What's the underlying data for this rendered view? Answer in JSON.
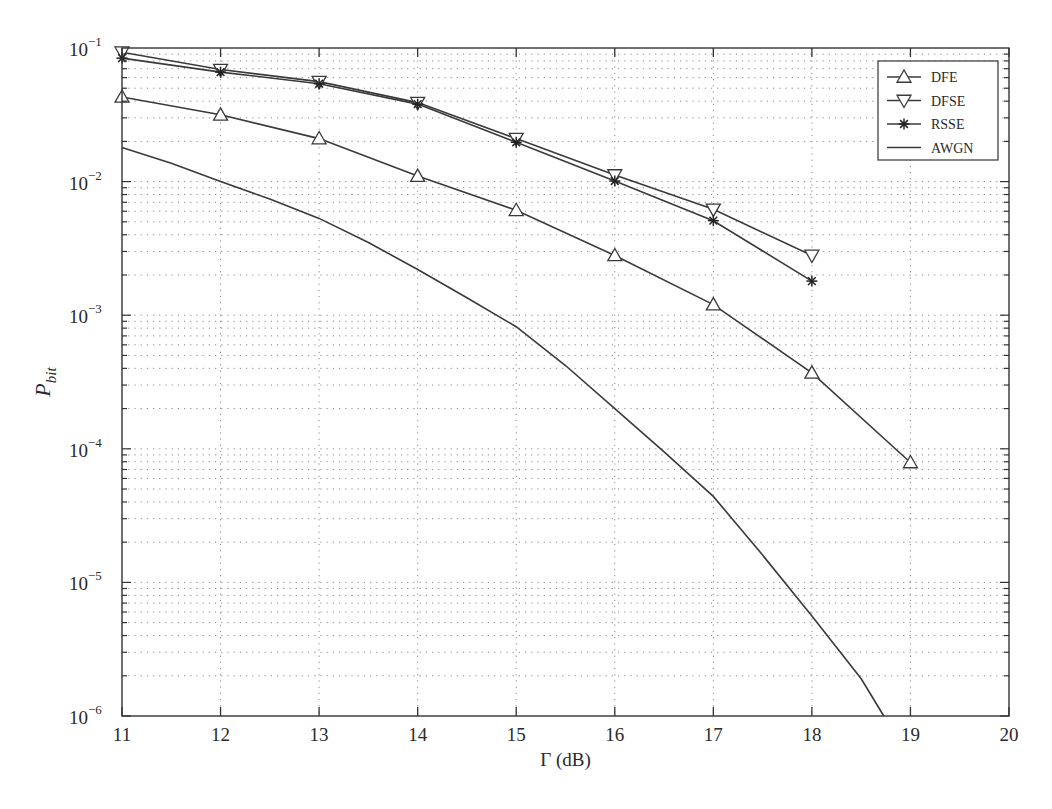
{
  "chart_data": {
    "type": "line",
    "title": "",
    "xlabel": "Γ (dB)",
    "ylabel": "P",
    "ylabel_subscript": "bit",
    "xscale": "linear",
    "yscale": "log",
    "xlim": [
      11,
      20
    ],
    "ylim": [
      1e-06,
      0.1
    ],
    "grid": true,
    "legend_position": "upper right",
    "x_ticks": [
      11,
      12,
      13,
      14,
      15,
      16,
      17,
      18,
      19,
      20
    ],
    "y_ticks": [
      {
        "value": 0.1,
        "base": "10",
        "exp": "−1"
      },
      {
        "value": 0.01,
        "base": "10",
        "exp": "−2"
      },
      {
        "value": 0.001,
        "base": "10",
        "exp": "−3"
      },
      {
        "value": 0.0001,
        "base": "10",
        "exp": "−4"
      },
      {
        "value": 1e-05,
        "base": "10",
        "exp": "−5"
      },
      {
        "value": 1e-06,
        "base": "10",
        "exp": "−6"
      }
    ],
    "series": [
      {
        "name": "DFE",
        "marker": "triangle-up",
        "x": [
          11,
          12,
          13,
          14,
          15,
          16,
          17,
          18,
          19
        ],
        "values": [
          0.043,
          0.0316,
          0.021,
          0.011,
          0.0061,
          0.0028,
          0.0012,
          0.00037,
          7.9e-05
        ]
      },
      {
        "name": "DFSE",
        "marker": "triangle-down",
        "x": [
          11,
          12,
          13,
          14,
          15,
          16,
          17,
          18
        ],
        "values": [
          0.093,
          0.069,
          0.056,
          0.039,
          0.021,
          0.0112,
          0.0062,
          0.0028
        ]
      },
      {
        "name": "RSSE",
        "marker": "asterisk",
        "x": [
          11,
          12,
          13,
          14,
          15,
          16,
          17,
          18
        ],
        "values": [
          0.084,
          0.066,
          0.054,
          0.038,
          0.0197,
          0.0101,
          0.0051,
          0.0018
        ]
      },
      {
        "name": "AWGN",
        "marker": "none",
        "x": [
          11,
          11.5,
          12,
          12.5,
          13,
          13.5,
          14,
          14.5,
          15,
          15.5,
          16,
          16.5,
          17,
          17.5,
          18,
          18.5,
          18.73
        ],
        "values": [
          0.018,
          0.0137,
          0.01,
          0.0074,
          0.0053,
          0.0035,
          0.0022,
          0.00135,
          0.00082,
          0.00042,
          0.0002,
          9.5e-05,
          4.4e-05,
          1.6e-05,
          5.6e-06,
          1.9e-06,
          1e-06
        ]
      }
    ]
  },
  "colors": {
    "line": "#3a3a3a",
    "grid": "#8a8a8a",
    "axis": "#333333",
    "background": "#ffffff"
  }
}
